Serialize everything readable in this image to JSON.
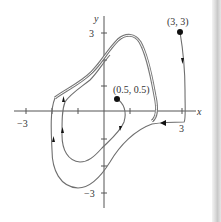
{
  "figure": {
    "type": "phase-portrait",
    "axes": {
      "x_label": "x",
      "y_label": "y",
      "x_ticks": [
        {
          "value": -3,
          "label": "−3"
        },
        {
          "value": -2,
          "label": ""
        },
        {
          "value": -1,
          "label": ""
        },
        {
          "value": 1,
          "label": ""
        },
        {
          "value": 2,
          "label": ""
        },
        {
          "value": 3,
          "label": "3"
        }
      ],
      "y_ticks": [
        {
          "value": 3,
          "label": "3"
        },
        {
          "value": 2,
          "label": ""
        },
        {
          "value": 1,
          "label": ""
        },
        {
          "value": -1,
          "label": ""
        },
        {
          "value": -2,
          "label": ""
        },
        {
          "value": -3,
          "label": "−3"
        }
      ]
    },
    "points": [
      {
        "label": "(3, 3)",
        "x": 3,
        "y": 3
      },
      {
        "label": "(0.5, 0.5)",
        "x": 0.5,
        "y": 0.5
      }
    ],
    "curves": [
      {
        "name": "limit-cycle",
        "style": "double-line"
      },
      {
        "name": "trajectory-from-3-3",
        "start": "(3, 3)",
        "direction": "approaches limit cycle from outside"
      },
      {
        "name": "trajectory-from-0.5-0.5",
        "start": "(0.5, 0.5)",
        "direction": "spirals outward to limit cycle"
      }
    ],
    "colors": {
      "curve": "#6e6e6e",
      "axis": "#555555",
      "point": "#111111",
      "text": "#333333"
    }
  }
}
